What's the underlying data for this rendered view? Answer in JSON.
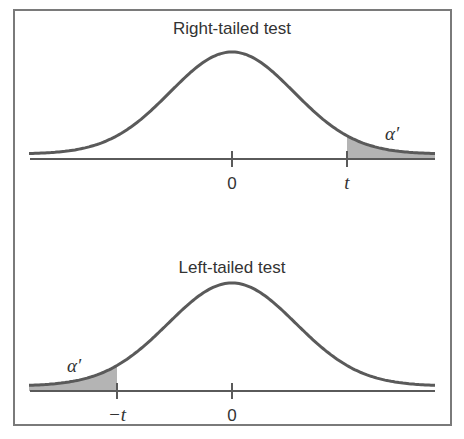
{
  "figure": {
    "frame_color": "#7a7a7a",
    "curve_color": "#5a5a5a",
    "shade_color": "#b4b4b4",
    "panels": [
      {
        "title": "Right-tailed test",
        "tick_labels": [
          "0",
          "t"
        ],
        "area_label": "α′",
        "shaded_tail": "right"
      },
      {
        "title": "Left-tailed test",
        "tick_labels": [
          "−t",
          "0"
        ],
        "area_label": "α′",
        "shaded_tail": "left"
      }
    ]
  }
}
